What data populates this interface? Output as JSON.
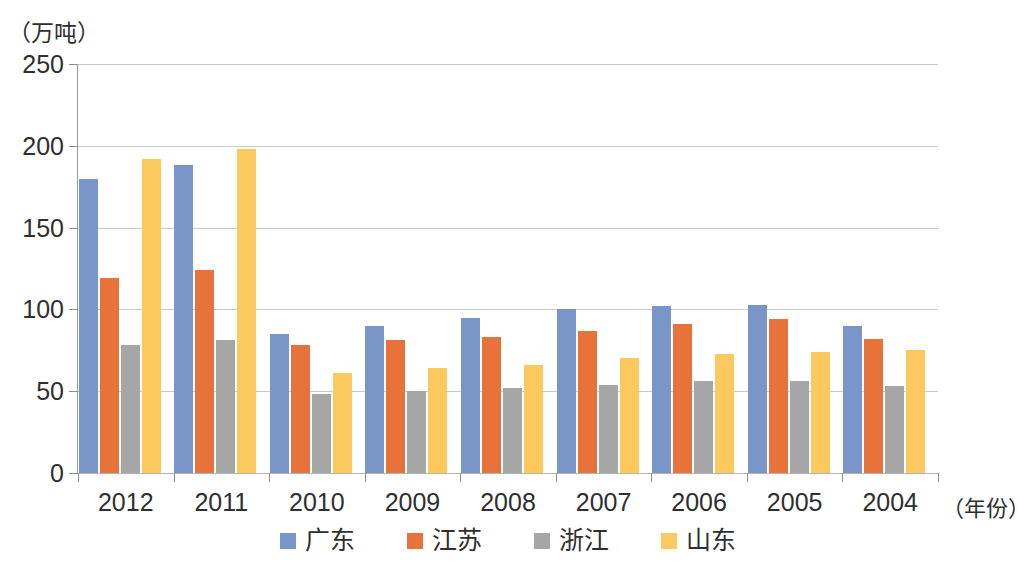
{
  "chart_data": {
    "type": "bar",
    "title": "",
    "subtitle": "",
    "xlabel": "（年份）",
    "ylabel": "（万吨）",
    "ylim": [
      0,
      250
    ],
    "yticks": [
      0,
      50,
      100,
      150,
      200,
      250
    ],
    "ytick_labels": [
      "0",
      "50",
      "100",
      "150",
      "200",
      "250"
    ],
    "grid": true,
    "legend_position": "bottom-center",
    "orientation": "vertical",
    "grouping": "clustered",
    "categories": [
      "2012",
      "2011",
      "2010",
      "2009",
      "2008",
      "2007",
      "2006",
      "2005",
      "2004"
    ],
    "series": [
      {
        "name": "广东",
        "color": "#7a96c8",
        "values": [
          180,
          188,
          85,
          90,
          95,
          100,
          102,
          103,
          90
        ]
      },
      {
        "name": "江苏",
        "color": "#e8733a",
        "values": [
          119,
          124,
          78,
          81,
          83,
          87,
          91,
          94,
          82
        ]
      },
      {
        "name": "浙江",
        "color": "#a6a6a6",
        "values": [
          78,
          81,
          48,
          50,
          52,
          54,
          56,
          56,
          53
        ]
      },
      {
        "name": "山东",
        "color": "#fbc95e",
        "values": [
          192,
          198,
          61,
          64,
          66,
          70,
          73,
          74,
          75
        ]
      }
    ]
  },
  "legend": {
    "items": [
      {
        "label": "广东",
        "color": "#7a96c8"
      },
      {
        "label": "江苏",
        "color": "#e8733a"
      },
      {
        "label": "浙江",
        "color": "#a6a6a6"
      },
      {
        "label": "山东",
        "color": "#fbc95e"
      }
    ]
  },
  "axis": {
    "y_unit": "（万吨）",
    "x_title": "（年份）"
  }
}
